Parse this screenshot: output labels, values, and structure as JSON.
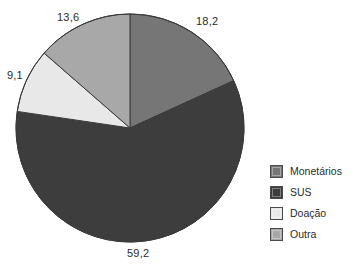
{
  "chart_data": {
    "type": "pie",
    "title": "",
    "subtitle": "",
    "xlabel": "",
    "ylabel": "",
    "grid": false,
    "legend_position": "right",
    "decimal_separator": ",",
    "start_angle_deg": 0,
    "direction": "clockwise",
    "total": 100.1,
    "categories": [
      "Monetários",
      "SUS",
      "Doação",
      "Outra"
    ],
    "values": [
      18.2,
      59.2,
      9.1,
      13.6
    ],
    "value_labels": [
      "18,2",
      "59,2",
      "9,1",
      "13,6"
    ],
    "colors": [
      "#767676",
      "#3d3d3d",
      "#e8e8e8",
      "#a8a8a8"
    ],
    "slices": [
      {
        "label": "Monetários",
        "value": 18.2,
        "value_label": "18,2",
        "color": "#767676",
        "start_deg": 0.0,
        "end_deg": 65.5
      },
      {
        "label": "SUS",
        "value": 59.2,
        "value_label": "59,2",
        "color": "#3d3d3d",
        "start_deg": 65.5,
        "end_deg": 278.6
      },
      {
        "label": "Doação",
        "value": 9.1,
        "value_label": "9,1",
        "color": "#e8e8e8",
        "start_deg": 278.6,
        "end_deg": 311.4
      },
      {
        "label": "Outra",
        "value": 13.6,
        "value_label": "13,6",
        "color": "#a8a8a8",
        "start_deg": 311.4,
        "end_deg": 360.0
      }
    ]
  },
  "pie": {
    "center_x": 130,
    "center_y": 128,
    "radius": 114,
    "outline_color": "#3a3a3a",
    "background": "#ffffff"
  },
  "labels": {
    "monetarios": "18,2",
    "sus": "59,2",
    "doacao": "9,1",
    "outra": "13,6"
  },
  "legend": {
    "items": [
      {
        "label": "Monetários",
        "color": "#767676"
      },
      {
        "label": "SUS",
        "color": "#3d3d3d"
      },
      {
        "label": "Doação",
        "color": "#e8e8e8"
      },
      {
        "label": "Outra",
        "color": "#a8a8a8"
      }
    ]
  }
}
